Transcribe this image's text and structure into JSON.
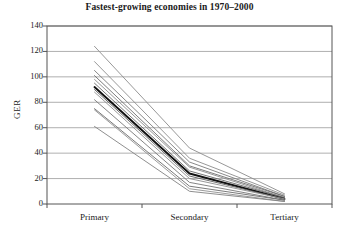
{
  "chart_data": {
    "type": "line",
    "title": "Fastest-growing economies in 1970–2000",
    "xlabel": "",
    "ylabel": "GER",
    "categories": [
      "Primary",
      "Secondary",
      "Tertiary"
    ],
    "ylim": [
      0,
      140
    ],
    "yticks": [
      0,
      20,
      40,
      60,
      80,
      100,
      120,
      140
    ],
    "ytick_labels": [
      "0",
      "20",
      "40",
      "60",
      "80",
      "100",
      "120",
      "140"
    ],
    "grid": "horizontal",
    "legend": "none",
    "series": [
      {
        "name": "economy-1",
        "values": [
          124,
          44,
          8
        ],
        "color": "#8c8c8c",
        "width": 0.9,
        "emphasis": false
      },
      {
        "name": "economy-2",
        "values": [
          112,
          36,
          7
        ],
        "color": "#8c8c8c",
        "width": 0.9,
        "emphasis": false
      },
      {
        "name": "economy-3",
        "values": [
          105,
          33,
          6
        ],
        "color": "#7a7a7a",
        "width": 0.9,
        "emphasis": false
      },
      {
        "name": "economy-4",
        "values": [
          101,
          30,
          6
        ],
        "color": "#6e6e6e",
        "width": 0.9,
        "emphasis": false
      },
      {
        "name": "economy-5",
        "values": [
          98,
          29,
          5
        ],
        "color": "#8c8c8c",
        "width": 0.9,
        "emphasis": false
      },
      {
        "name": "economy-6",
        "values": [
          95,
          26,
          5
        ],
        "color": "#666666",
        "width": 0.9,
        "emphasis": false
      },
      {
        "name": "economy-7",
        "values": [
          92,
          24,
          4
        ],
        "color": "#111111",
        "width": 1.9,
        "emphasis": true
      },
      {
        "name": "economy-8",
        "values": [
          90,
          22,
          4
        ],
        "color": "#5e5e5e",
        "width": 0.9,
        "emphasis": false
      },
      {
        "name": "economy-9",
        "values": [
          88,
          20,
          4
        ],
        "color": "#8c8c8c",
        "width": 0.9,
        "emphasis": false
      },
      {
        "name": "economy-10",
        "values": [
          82,
          17,
          3
        ],
        "color": "#777777",
        "width": 0.9,
        "emphasis": false
      },
      {
        "name": "economy-11",
        "values": [
          75,
          14,
          3
        ],
        "color": "#6b6b6b",
        "width": 0.9,
        "emphasis": false
      },
      {
        "name": "economy-12",
        "values": [
          74,
          12,
          2
        ],
        "color": "#909090",
        "width": 0.9,
        "emphasis": false
      },
      {
        "name": "economy-13",
        "values": [
          61,
          10,
          2
        ],
        "color": "#828282",
        "width": 0.9,
        "emphasis": false
      }
    ]
  },
  "axes": {
    "plot_left": 47,
    "plot_right": 332,
    "plot_top": 26,
    "plot_bottom": 204,
    "frame_color": "#555555",
    "grid_color": "#9a9a9a"
  }
}
